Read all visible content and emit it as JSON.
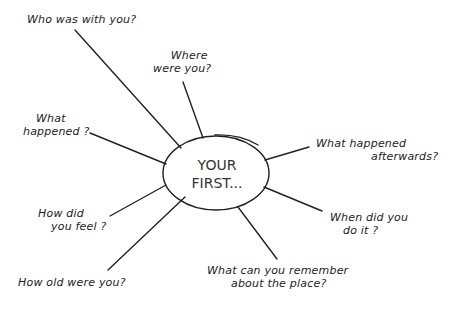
{
  "diagram": {
    "type": "spider-diagram",
    "center": {
      "line1": "YOUR",
      "line2": "FIRST..."
    },
    "questions": [
      {
        "id": "who",
        "line1": "Who was with you?"
      },
      {
        "id": "where",
        "line1": "Where",
        "line2": "were you?"
      },
      {
        "id": "what-happened",
        "line1": "What",
        "line2": "happened ?"
      },
      {
        "id": "afterwards",
        "line1": "What happened",
        "line2": "afterwards?"
      },
      {
        "id": "feel",
        "line1": "How did",
        "line2": "you feel ?"
      },
      {
        "id": "when",
        "line1": "When did you",
        "line2": "do it ?"
      },
      {
        "id": "place",
        "line1": "What can you remember",
        "line2": "about the place?"
      },
      {
        "id": "age",
        "line1": "How old were you?"
      }
    ]
  }
}
